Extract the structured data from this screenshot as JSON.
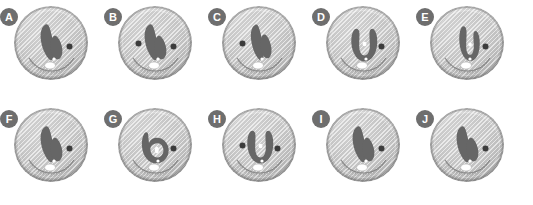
{
  "figure": {
    "background_color": "#ffffff",
    "layout": {
      "rows": 2,
      "columns": 5
    },
    "disc_color": "#cacaca",
    "disc_rim_color": "#777777",
    "structure_color": "#666666",
    "dot_color": "#3c3c3c",
    "highlight_color": "#ffffff",
    "badge_color": "#6e6e6e",
    "badge_text_color": "#ffffff"
  },
  "panels": [
    {
      "label": "A",
      "row": 0,
      "col": 0,
      "shape": "v-shape-wide",
      "dots": [
        "right"
      ],
      "has_arc": true,
      "has_white_ellipse": true
    },
    {
      "label": "B",
      "row": 0,
      "col": 1,
      "shape": "v-shape-wide",
      "dots": [
        "left",
        "right"
      ],
      "has_arc": true,
      "has_white_ellipse": true
    },
    {
      "label": "C",
      "row": 0,
      "col": 2,
      "shape": "v-shape-narrow",
      "dots": [
        "left"
      ],
      "has_arc": true,
      "has_white_ellipse": true
    },
    {
      "label": "D",
      "row": 0,
      "col": 3,
      "shape": "u-shape",
      "dots": [
        "right"
      ],
      "has_arc": true,
      "has_white_ellipse": true
    },
    {
      "label": "E",
      "row": 0,
      "col": 4,
      "shape": "u-shape-narrow",
      "dots": [
        "right"
      ],
      "has_arc": true,
      "has_white_ellipse": true
    },
    {
      "label": "F",
      "row": 1,
      "col": 0,
      "shape": "v-shape-wide",
      "dots": [
        "right"
      ],
      "has_arc": true,
      "has_white_ellipse": true
    },
    {
      "label": "G",
      "row": 1,
      "col": 1,
      "shape": "loop-shape",
      "dots": [
        "right"
      ],
      "has_arc": true,
      "has_white_ellipse": true
    },
    {
      "label": "H",
      "row": 1,
      "col": 2,
      "shape": "u-shape",
      "dots": [
        "left",
        "right"
      ],
      "has_arc": true,
      "has_white_ellipse": true
    },
    {
      "label": "I",
      "row": 1,
      "col": 3,
      "shape": "v-shape-wide",
      "dots": [
        "right"
      ],
      "has_arc": true,
      "has_white_ellipse": true
    },
    {
      "label": "J",
      "row": 1,
      "col": 4,
      "shape": "v-shape-wide",
      "dots": [
        "right"
      ],
      "has_arc": true,
      "has_white_ellipse": true
    }
  ]
}
